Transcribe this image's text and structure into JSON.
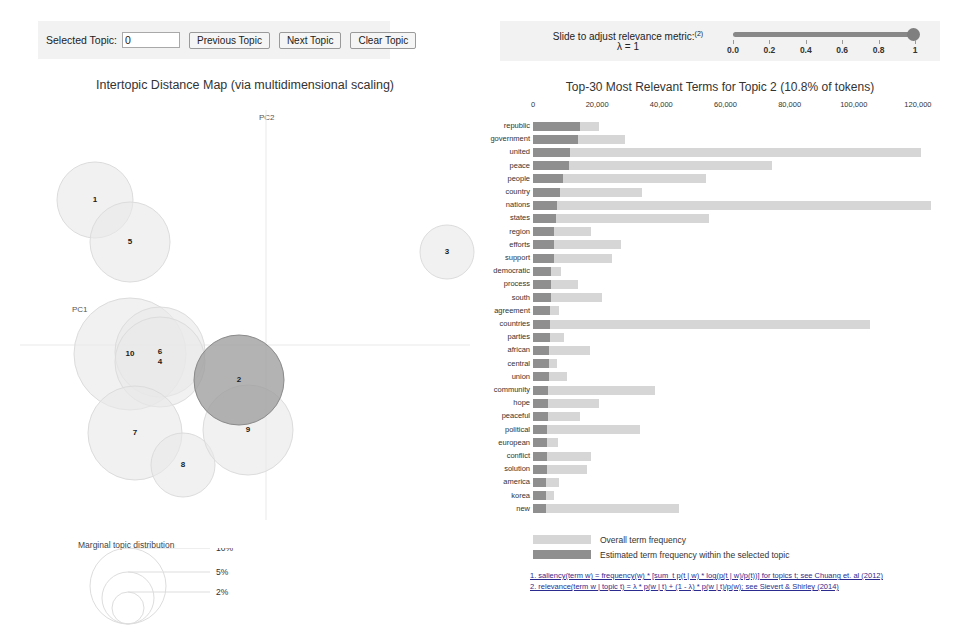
{
  "controls": {
    "selected_topic_label": "Selected Topic:",
    "selected_topic_value": "0",
    "previous_topic_label": "Previous Topic",
    "next_topic_label": "Next Topic",
    "clear_topic_label": "Clear Topic"
  },
  "lambda": {
    "caption": "Slide to adjust relevance metric:",
    "caption_superscript": "(2)",
    "value_label": "λ = 1",
    "value": 1,
    "ticks": [
      "0.0",
      "0.2",
      "0.4",
      "0.6",
      "0.8",
      "1"
    ]
  },
  "intertopic_map": {
    "title": "Intertopic Distance Map (via multidimensional scaling)",
    "axis_x_label": "PC1",
    "axis_y_label": "PC2",
    "selected_topic": 2,
    "topics": [
      {
        "id": 1,
        "cx": 95,
        "cy": 110,
        "r": 38,
        "selected": false
      },
      {
        "id": 5,
        "cx": 130,
        "cy": 152,
        "r": 40,
        "selected": false
      },
      {
        "id": 10,
        "cx": 130,
        "cy": 264,
        "r": 56,
        "selected": false
      },
      {
        "id": 6,
        "cx": 160,
        "cy": 262,
        "r": 45,
        "selected": false
      },
      {
        "id": 4,
        "cx": 160,
        "cy": 272,
        "r": 45,
        "selected": false
      },
      {
        "id": 7,
        "cx": 135,
        "cy": 343,
        "r": 47,
        "selected": false
      },
      {
        "id": 8,
        "cx": 183,
        "cy": 375,
        "r": 32,
        "selected": false
      },
      {
        "id": 9,
        "cx": 248,
        "cy": 340,
        "r": 45,
        "selected": false
      },
      {
        "id": 2,
        "cx": 239,
        "cy": 290,
        "r": 45,
        "selected": true
      },
      {
        "id": 3,
        "cx": 447,
        "cy": 162,
        "r": 27,
        "selected": false
      }
    ]
  },
  "marginal_distribution": {
    "title": "Marginal topic distribution",
    "sizes": [
      {
        "label": "2%",
        "r": 16
      },
      {
        "label": "5%",
        "r": 26
      },
      {
        "label": "10%",
        "r": 38
      }
    ]
  },
  "chart_data": {
    "type": "bar",
    "title": "Top-30 Most Relevant Terms for Topic 2 (10.8% of tokens)",
    "topic": 2,
    "topic_token_pct": "10.8%",
    "orientation": "horizontal",
    "xlabel": "",
    "ylabel": "",
    "xlim": [
      0,
      130000
    ],
    "grid": false,
    "legend_position": "bottom",
    "tick_values": [
      0,
      20000,
      40000,
      60000,
      80000,
      100000,
      120000
    ],
    "tick_labels": [
      "0",
      "20,000",
      "40,000",
      "60,000",
      "80,000",
      "100,000",
      "120,000"
    ],
    "categories": [
      "republic",
      "government",
      "united",
      "peace",
      "people",
      "country",
      "nations",
      "states",
      "region",
      "efforts",
      "support",
      "democratic",
      "process",
      "south",
      "agreement",
      "countries",
      "parties",
      "african",
      "central",
      "union",
      "community",
      "hope",
      "peaceful",
      "political",
      "european",
      "conflict",
      "solution",
      "america",
      "korea",
      "new"
    ],
    "series": [
      {
        "name": "Overall term frequency",
        "values": [
          20500,
          28800,
          121000,
          74500,
          54000,
          33900,
          124000,
          55000,
          18000,
          27500,
          24700,
          8800,
          14000,
          21500,
          8000,
          105000,
          9800,
          17700,
          7400,
          10500,
          38000,
          20500,
          14500,
          33500,
          7800,
          18000,
          16800,
          8200,
          6500,
          45500
        ]
      },
      {
        "name": "Estimated term frequency within the selected topic",
        "values": [
          14500,
          13900,
          11500,
          11200,
          9300,
          8500,
          7600,
          7300,
          6700,
          6500,
          6400,
          5700,
          5600,
          5500,
          5400,
          5300,
          5200,
          5100,
          5000,
          4900,
          4800,
          4700,
          4600,
          4500,
          4450,
          4400,
          4300,
          4200,
          4100,
          4000
        ]
      }
    ],
    "legend": [
      {
        "label": "Overall term frequency",
        "color": "#d6d6d6"
      },
      {
        "label": "Estimated term frequency within the selected topic",
        "color": "#8f8f8f"
      }
    ]
  },
  "footnotes": [
    "1. saliency(term w) = frequency(w) * [sum_t p(t | w) * log(p(t | w)/p(t))] for topics t; see Chuang et. al (2012)",
    "2. relevance(term w | topic t) = λ * p(w | t) + (1 - λ) * p(w | t)/p(w); see Sievert & Shirley (2014)"
  ],
  "colors": {
    "bar_overall": "#d6d6d6",
    "bar_selected": "#8f8f8f",
    "circle_default": "#e8e8e8",
    "circle_selected": "#9d9d9d",
    "panel_bg": "#f2f2f2"
  }
}
